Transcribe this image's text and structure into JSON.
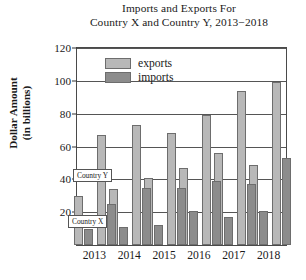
{
  "chart_data": {
    "type": "bar",
    "title_lines": [
      "Imports and Exports For",
      "Country X and Country Y, 2013−2018"
    ],
    "xlabel": "",
    "ylabel": "Dollar Amount (in billions)",
    "ylabel_lines": [
      "Dollar Amount",
      "(in billions)"
    ],
    "categories": [
      "2013",
      "2014",
      "2015",
      "2016",
      "2017",
      "2018"
    ],
    "ylim": [
      0,
      120
    ],
    "yticks": [
      20,
      40,
      60,
      80,
      100,
      120
    ],
    "grid": true,
    "legend_position": "upper-left-inside",
    "legend": [
      "exports",
      "imports"
    ],
    "series": [
      {
        "name": "Country X exports",
        "country": "Country X",
        "kind": "exports",
        "values": [
          30,
          34,
          41,
          47,
          56,
          49
        ]
      },
      {
        "name": "Country X imports",
        "country": "Country X",
        "kind": "imports",
        "values": [
          10,
          11,
          12,
          21,
          17,
          21
        ]
      },
      {
        "name": "Country Y exports",
        "country": "Country Y",
        "kind": "exports",
        "values": [
          67,
          73,
          68,
          79,
          94,
          99
        ]
      },
      {
        "name": "Country Y imports",
        "country": "Country Y",
        "kind": "imports",
        "values": [
          25,
          35,
          35,
          39,
          37,
          53
        ]
      }
    ],
    "annotations": [
      {
        "label": "Country Y",
        "target": "Country Y bar pair"
      },
      {
        "label": "Country X",
        "target": "Country X bar pair"
      }
    ],
    "colors": {
      "exports": "#b8b8b8",
      "imports": "#8c8c8c",
      "bar_outline": "#6d6d6d",
      "axis": "#4a4a4a",
      "grid": "#555555",
      "background": "#ffffff"
    }
  }
}
